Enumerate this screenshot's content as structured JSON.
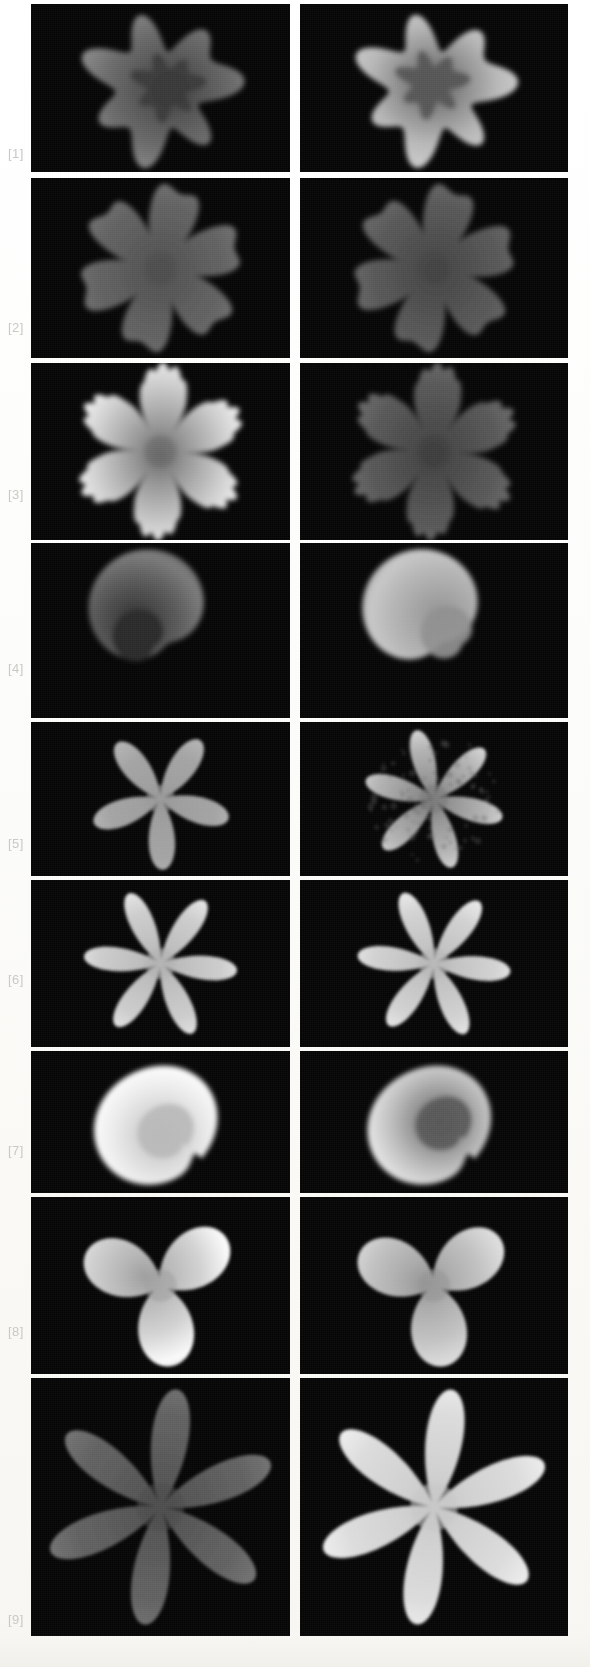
{
  "figure": {
    "type": "grayscale-panel-grid",
    "background_color": "#fdfdfb",
    "panel_background_color": "#050505",
    "label_color": "#c9c9c6",
    "columns": 2,
    "rows": 9,
    "page_width": 590,
    "page_height": 1667
  },
  "row_labels": [
    {
      "text": "[1]"
    },
    {
      "text": "[2]"
    },
    {
      "text": "[3]"
    },
    {
      "text": "[4]"
    },
    {
      "text": "[5]"
    },
    {
      "text": "[6]"
    },
    {
      "text": "[7]"
    },
    {
      "text": "[8]"
    },
    {
      "text": "[9]"
    }
  ],
  "chart_data": {
    "type": "heatmap",
    "title": "",
    "xlabel": "",
    "ylabel": "",
    "legend_position": "none",
    "grid": false,
    "colormap": "grayscale",
    "value_range": [
      0,
      1
    ],
    "panels": [
      {
        "row": 1,
        "column": 1,
        "label": "[1]",
        "shape": "irregular-lobed-blob",
        "lobes": 7,
        "mean_intensity": 0.42,
        "peak_intensity": 0.55,
        "core_intensity": 0.22,
        "core_position": [
          0.55,
          0.48
        ],
        "fill_fraction": 0.46
      },
      {
        "row": 1,
        "column": 2,
        "label": "[1]",
        "shape": "irregular-lobed-blob",
        "lobes": 7,
        "mean_intensity": 0.72,
        "peak_intensity": 0.82,
        "core_intensity": 0.33,
        "core_position": [
          0.48,
          0.45
        ],
        "fill_fraction": 0.48
      },
      {
        "row": 2,
        "column": 1,
        "label": "[2]",
        "shape": "six-lobe-maple-star",
        "lobes": 6,
        "mean_intensity": 0.38,
        "peak_intensity": 0.46,
        "core_intensity": 0.3,
        "core_position": [
          0.5,
          0.52
        ],
        "fill_fraction": 0.34
      },
      {
        "row": 2,
        "column": 2,
        "label": "[2]",
        "shape": "six-lobe-maple-star",
        "lobes": 6,
        "mean_intensity": 0.34,
        "peak_intensity": 0.42,
        "core_intensity": 0.26,
        "core_position": [
          0.52,
          0.52
        ],
        "fill_fraction": 0.32
      },
      {
        "row": 3,
        "column": 1,
        "label": "[3]",
        "shape": "six-lobe-spiky-star",
        "lobes": 6,
        "mean_intensity": 0.8,
        "peak_intensity": 0.98,
        "core_intensity": 0.4,
        "core_position": [
          0.5,
          0.52
        ],
        "fill_fraction": 0.36
      },
      {
        "row": 3,
        "column": 2,
        "label": "[3]",
        "shape": "six-lobe-spiky-star",
        "lobes": 6,
        "mean_intensity": 0.34,
        "peak_intensity": 0.44,
        "core_intensity": 0.24,
        "core_position": [
          0.5,
          0.52
        ],
        "fill_fraction": 0.33
      },
      {
        "row": 4,
        "column": 1,
        "label": "[4]",
        "shape": "single-main-lobe-ellipsoid",
        "lobes": 1,
        "mean_intensity": 0.36,
        "peak_intensity": 0.48,
        "core_intensity": 0.16,
        "core_position": [
          0.42,
          0.66
        ],
        "fill_fraction": 0.3
      },
      {
        "row": 4,
        "column": 2,
        "label": "[4]",
        "shape": "single-main-lobe-ellipsoid",
        "lobes": 1,
        "mean_intensity": 0.7,
        "peak_intensity": 0.78,
        "core_intensity": 0.56,
        "core_position": [
          0.68,
          0.58
        ],
        "fill_fraction": 0.31
      },
      {
        "row": 5,
        "column": 1,
        "label": "[5]",
        "shape": "five-petal-rosette",
        "lobes": 5,
        "mean_intensity": 0.64,
        "peak_intensity": 0.72,
        "core_intensity": 0.6,
        "core_position": [
          0.5,
          0.52
        ],
        "fill_fraction": 0.26
      },
      {
        "row": 5,
        "column": 2,
        "label": "[5]",
        "shape": "six-petal-rosette-mottled",
        "lobes": 6,
        "mean_intensity": 0.7,
        "peak_intensity": 0.88,
        "core_intensity": 0.48,
        "core_position": [
          0.48,
          0.52
        ],
        "fill_fraction": 0.28
      },
      {
        "row": 6,
        "column": 1,
        "label": "[6]",
        "shape": "six-petal-rosette",
        "lobes": 6,
        "mean_intensity": 0.8,
        "peak_intensity": 0.92,
        "core_intensity": 0.7,
        "core_position": [
          0.5,
          0.52
        ],
        "fill_fraction": 0.27
      },
      {
        "row": 6,
        "column": 2,
        "label": "[6]",
        "shape": "six-petal-rosette",
        "lobes": 6,
        "mean_intensity": 0.82,
        "peak_intensity": 0.94,
        "core_intensity": 0.72,
        "core_position": [
          0.5,
          0.52
        ],
        "fill_fraction": 0.28
      },
      {
        "row": 7,
        "column": 1,
        "label": "[7]",
        "shape": "broad-disc-with-notch",
        "lobes": 1,
        "mean_intensity": 0.92,
        "peak_intensity": 1.0,
        "core_intensity": 0.72,
        "core_position": [
          0.56,
          0.58
        ],
        "fill_fraction": 0.44
      },
      {
        "row": 7,
        "column": 2,
        "label": "[7]",
        "shape": "broad-disc-with-notch",
        "lobes": 1,
        "mean_intensity": 0.74,
        "peak_intensity": 0.9,
        "core_intensity": 0.34,
        "core_position": [
          0.58,
          0.46
        ],
        "fill_fraction": 0.46
      },
      {
        "row": 8,
        "column": 1,
        "label": "[8]",
        "shape": "trefoil-three-lobe",
        "lobes": 3,
        "mean_intensity": 0.82,
        "peak_intensity": 0.98,
        "core_intensity": 0.62,
        "core_position": [
          0.44,
          0.42
        ],
        "fill_fraction": 0.33
      },
      {
        "row": 8,
        "column": 2,
        "label": "[8]",
        "shape": "trefoil-three-lobe",
        "lobes": 3,
        "mean_intensity": 0.76,
        "peak_intensity": 0.88,
        "core_intensity": 0.58,
        "core_position": [
          0.5,
          0.46
        ],
        "fill_fraction": 0.34
      },
      {
        "row": 9,
        "column": 1,
        "label": "[9]",
        "shape": "six-petal-rosette",
        "lobes": 6,
        "mean_intensity": 0.38,
        "peak_intensity": 0.48,
        "core_intensity": 0.3,
        "core_position": [
          0.5,
          0.5
        ],
        "fill_fraction": 0.24
      },
      {
        "row": 9,
        "column": 2,
        "label": "[9]",
        "shape": "six-petal-rosette",
        "lobes": 6,
        "mean_intensity": 0.86,
        "peak_intensity": 0.96,
        "core_intensity": 0.78,
        "core_position": [
          0.5,
          0.5
        ],
        "fill_fraction": 0.24
      }
    ]
  }
}
